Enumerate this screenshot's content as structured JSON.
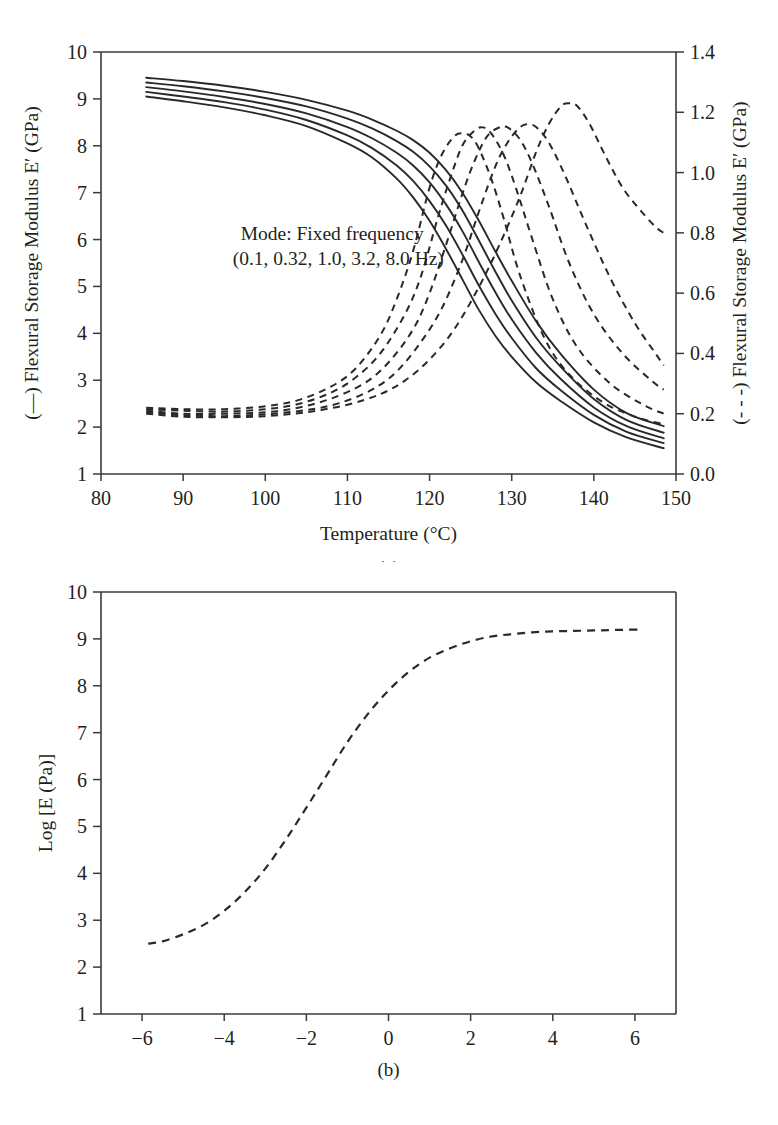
{
  "figure": {
    "title": "",
    "panels": [
      "a",
      "b"
    ]
  },
  "panel_a": {
    "tag": "(a)",
    "xlabel": "Temperature (°C)",
    "ylabel_left": "(—) Flexural Storage Modulus E′ (GPa)",
    "ylabel_right": "(- - -) Flexural Storage Modulus E′ (GPa)",
    "annotation_line1": "Mode: Fixed frequency",
    "annotation_line2": "(0.1, 0.32, 1.0, 3.2, 8.0 Hz)",
    "xticks": [
      "80",
      "90",
      "100",
      "110",
      "120",
      "130",
      "140",
      "150"
    ],
    "yticks_left": [
      "10",
      "9",
      "8",
      "7",
      "6",
      "5",
      "4",
      "3",
      "2",
      "1"
    ],
    "yticks_right": [
      "1.4",
      "1.2",
      "1.0",
      "0.8",
      "0.6",
      "0.4",
      "0.2",
      "0.0"
    ]
  },
  "panel_b": {
    "tag": "(b)",
    "xlabel": "",
    "ylabel": "Log [E (Pa)]",
    "xticks": [
      "−6",
      "−4",
      "−2",
      "0",
      "2",
      "4",
      "6"
    ],
    "yticks": [
      "10",
      "9",
      "8",
      "7",
      "6",
      "5",
      "4",
      "3",
      "2",
      "1"
    ]
  },
  "colors": {
    "ink": "#231f20",
    "axis": "#3c3a3b",
    "background": "#ffffff"
  },
  "chart_data": [
    {
      "type": "line",
      "panel": "a",
      "title": "",
      "xlabel": "Temperature (°C)",
      "ylabel": "(—) Flexural Storage Modulus E′ (GPa)",
      "ylabel_secondary": "(- - -) Flexural Storage Modulus E′ (GPa)",
      "xlim": [
        80,
        150
      ],
      "ylim": [
        1,
        10
      ],
      "ylim_secondary": [
        0.0,
        1.4
      ],
      "xtick_values": [
        80,
        90,
        100,
        110,
        120,
        130,
        140,
        150
      ],
      "ytick_values": [
        1,
        2,
        3,
        4,
        5,
        6,
        7,
        8,
        9,
        10
      ],
      "ytick_values_secondary": [
        0.0,
        0.2,
        0.4,
        0.6,
        0.8,
        1.0,
        1.2,
        1.4
      ],
      "grid": false,
      "legend": "none",
      "annotations": [
        {
          "text": "Mode: Fixed frequency\n(0.1, 0.32, 1.0, 3.2, 8.0 Hz)",
          "x": 97,
          "y": 6.0
        }
      ],
      "series": [
        {
          "name": "E' storage, 0.1 Hz",
          "style": "solid",
          "axis": "left",
          "frequency_hz": 0.1,
          "x": [
            85.5,
            90,
            95,
            100,
            105,
            110,
            113,
            116,
            118,
            120,
            122,
            124,
            126,
            128,
            130,
            133,
            136,
            140,
            144,
            148.5
          ],
          "y": [
            9.05,
            8.95,
            8.82,
            8.65,
            8.42,
            8.05,
            7.75,
            7.3,
            6.9,
            6.4,
            5.8,
            5.15,
            4.5,
            3.95,
            3.5,
            2.95,
            2.55,
            2.1,
            1.78,
            1.55
          ]
        },
        {
          "name": "E' storage, 0.32 Hz",
          "style": "solid",
          "axis": "left",
          "frequency_hz": 0.32,
          "x": [
            85.5,
            90,
            95,
            100,
            105,
            110,
            113,
            116,
            118,
            120,
            122,
            124,
            126,
            128,
            130,
            133,
            136,
            140,
            144,
            148.5
          ],
          "y": [
            9.15,
            9.05,
            8.93,
            8.77,
            8.55,
            8.22,
            7.95,
            7.58,
            7.25,
            6.82,
            6.3,
            5.68,
            5.02,
            4.42,
            3.9,
            3.25,
            2.78,
            2.26,
            1.9,
            1.66
          ]
        },
        {
          "name": "E' storage, 1.0 Hz",
          "style": "solid",
          "axis": "left",
          "frequency_hz": 1.0,
          "x": [
            85.5,
            90,
            95,
            100,
            105,
            110,
            113,
            116,
            118,
            120,
            122,
            124,
            126,
            128,
            130,
            133,
            136,
            140,
            144,
            148.5
          ],
          "y": [
            9.25,
            9.16,
            9.04,
            8.89,
            8.69,
            8.4,
            8.16,
            7.85,
            7.58,
            7.22,
            6.75,
            6.18,
            5.52,
            4.88,
            4.3,
            3.58,
            3.02,
            2.42,
            2.02,
            1.76
          ]
        },
        {
          "name": "E' storage, 3.2 Hz",
          "style": "solid",
          "axis": "left",
          "frequency_hz": 3.2,
          "x": [
            85.5,
            90,
            95,
            100,
            105,
            110,
            113,
            116,
            118,
            120,
            122,
            124,
            126,
            128,
            130,
            133,
            136,
            140,
            144,
            148.5
          ],
          "y": [
            9.35,
            9.27,
            9.16,
            9.02,
            8.84,
            8.58,
            8.37,
            8.1,
            7.87,
            7.56,
            7.15,
            6.62,
            5.98,
            5.32,
            4.7,
            3.9,
            3.28,
            2.6,
            2.15,
            1.88
          ]
        },
        {
          "name": "E' storage, 8.0 Hz",
          "style": "solid",
          "axis": "left",
          "frequency_hz": 8.0,
          "x": [
            85.5,
            90,
            95,
            100,
            105,
            110,
            113,
            116,
            118,
            120,
            122,
            124,
            126,
            128,
            130,
            133,
            136,
            140,
            144,
            148.5
          ],
          "y": [
            9.45,
            9.38,
            9.28,
            9.15,
            8.98,
            8.75,
            8.56,
            8.32,
            8.12,
            7.85,
            7.48,
            7.0,
            6.4,
            5.75,
            5.12,
            4.25,
            3.55,
            2.8,
            2.3,
            2.02
          ]
        },
        {
          "name": "E'' loss, 0.1 Hz",
          "style": "dashed",
          "axis": "right",
          "frequency_hz": 0.1,
          "x": [
            85.5,
            90,
            95,
            100,
            104,
            108,
            111,
            114,
            116,
            118,
            120,
            121.5,
            123,
            124,
            125,
            126,
            127.5,
            129,
            131,
            134,
            137,
            141,
            145,
            148.5
          ],
          "y": [
            0.22,
            0.215,
            0.215,
            0.225,
            0.245,
            0.29,
            0.35,
            0.46,
            0.58,
            0.74,
            0.95,
            1.06,
            1.12,
            1.13,
            1.12,
            1.08,
            0.98,
            0.85,
            0.66,
            0.45,
            0.33,
            0.24,
            0.19,
            0.165
          ]
        },
        {
          "name": "E'' loss, 0.32 Hz",
          "style": "dashed",
          "axis": "right",
          "frequency_hz": 0.32,
          "x": [
            85.5,
            90,
            95,
            100,
            104,
            108,
            111,
            114,
            117,
            119,
            121,
            122.5,
            124,
            125.5,
            126.5,
            127.5,
            129,
            130.5,
            132.5,
            135,
            138,
            142,
            146,
            148.5
          ],
          "y": [
            0.215,
            0.21,
            0.207,
            0.215,
            0.232,
            0.27,
            0.32,
            0.4,
            0.53,
            0.66,
            0.85,
            0.98,
            1.09,
            1.14,
            1.15,
            1.13,
            1.06,
            0.95,
            0.78,
            0.58,
            0.42,
            0.3,
            0.23,
            0.2
          ]
        },
        {
          "name": "E'' loss, 1.0 Hz",
          "style": "dashed",
          "axis": "right",
          "frequency_hz": 1.0,
          "x": [
            85.5,
            90,
            95,
            100,
            104,
            108,
            112,
            115,
            118,
            120,
            122,
            124,
            125.5,
            127,
            128.5,
            129.5,
            131,
            132.5,
            134.5,
            137,
            140,
            143.5,
            147,
            148.5
          ],
          "y": [
            0.21,
            0.2,
            0.2,
            0.205,
            0.22,
            0.25,
            0.3,
            0.37,
            0.48,
            0.6,
            0.76,
            0.93,
            1.04,
            1.12,
            1.15,
            1.15,
            1.11,
            1.03,
            0.89,
            0.7,
            0.53,
            0.4,
            0.31,
            0.28
          ]
        },
        {
          "name": "E'' loss, 3.2 Hz",
          "style": "dashed",
          "axis": "right",
          "frequency_hz": 3.2,
          "x": [
            85.5,
            90,
            95,
            100,
            105,
            109,
            113,
            116,
            119,
            121.5,
            124,
            126,
            128,
            129.5,
            131,
            132,
            133,
            134.5,
            136.5,
            139,
            142,
            145,
            147.5,
            148.5
          ],
          "y": [
            0.205,
            0.195,
            0.192,
            0.198,
            0.212,
            0.235,
            0.28,
            0.34,
            0.44,
            0.55,
            0.71,
            0.87,
            1.02,
            1.1,
            1.15,
            1.16,
            1.15,
            1.1,
            0.99,
            0.83,
            0.65,
            0.5,
            0.4,
            0.36
          ]
        },
        {
          "name": "E'' loss, 8.0 Hz",
          "style": "dashed",
          "axis": "right",
          "frequency_hz": 8.0,
          "x": [
            85.5,
            90,
            95,
            100,
            105,
            110,
            114,
            117,
            120,
            123,
            126,
            128.5,
            131,
            133,
            134.5,
            136,
            137,
            138,
            139.5,
            141.5,
            143.5,
            145.5,
            147.5,
            148.5
          ],
          "y": [
            0.2,
            0.19,
            0.188,
            0.192,
            0.205,
            0.23,
            0.265,
            0.31,
            0.38,
            0.48,
            0.62,
            0.76,
            0.92,
            1.07,
            1.16,
            1.22,
            1.23,
            1.22,
            1.16,
            1.05,
            0.95,
            0.88,
            0.82,
            0.8
          ]
        }
      ]
    },
    {
      "type": "line",
      "panel": "b",
      "title": "",
      "xlabel": "",
      "ylabel": "Log [E (Pa)]",
      "xlim": [
        -7,
        7
      ],
      "ylim": [
        1,
        10
      ],
      "xtick_values": [
        -6,
        -4,
        -2,
        0,
        2,
        4,
        6
      ],
      "ytick_values": [
        1,
        2,
        3,
        4,
        5,
        6,
        7,
        8,
        9,
        10
      ],
      "grid": false,
      "legend": "none",
      "series": [
        {
          "name": "Master curve Log[E (Pa)]",
          "style": "dashed",
          "x": [
            -5.85,
            -5.5,
            -5.0,
            -4.5,
            -4.0,
            -3.5,
            -3.0,
            -2.5,
            -2.0,
            -1.5,
            -1.0,
            -0.5,
            0.0,
            0.5,
            1.0,
            1.5,
            2.0,
            2.5,
            3.0,
            3.5,
            4.0,
            4.5,
            5.0,
            5.5,
            6.1
          ],
          "y": [
            2.5,
            2.55,
            2.7,
            2.9,
            3.2,
            3.6,
            4.1,
            4.72,
            5.4,
            6.1,
            6.8,
            7.4,
            7.9,
            8.3,
            8.6,
            8.8,
            8.95,
            9.05,
            9.1,
            9.14,
            9.16,
            9.17,
            9.18,
            9.19,
            9.2
          ]
        }
      ]
    }
  ]
}
